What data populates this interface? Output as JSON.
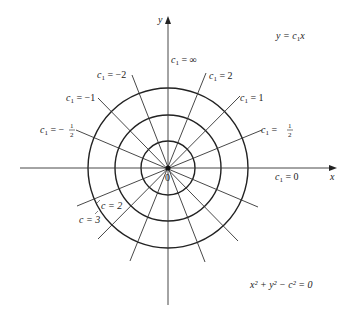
{
  "diagram": {
    "title_equation": "y = c₁x",
    "circle_equation": "x² + y² − c² = 0",
    "axes": {
      "x_label": "x",
      "y_label": "y",
      "origin_label": "0"
    },
    "center": [
      168,
      168
    ],
    "circles": [
      {
        "c": 1,
        "radius_px": 27
      },
      {
        "c": 2,
        "radius_px": 53,
        "label": "c = 2"
      },
      {
        "c": 3,
        "radius_px": 80,
        "label": "c = 3"
      }
    ],
    "lines": [
      {
        "c1": "∞",
        "label": "c₁ = ∞"
      },
      {
        "c1": "2",
        "label": "c₁ = 2"
      },
      {
        "c1": "1",
        "label": "c₁ = 1"
      },
      {
        "c1": "1/2",
        "label": "c₁ = 1/2"
      },
      {
        "c1": "0",
        "label": "c₁ = 0"
      },
      {
        "c1": "-1/2",
        "label": "c₁ = −1/2"
      },
      {
        "c1": "-1",
        "label": "c₁ = −1"
      },
      {
        "c1": "-2",
        "label": "c₁ = −2"
      }
    ],
    "text": {
      "c1_prefix": "c",
      "sub1": "1",
      "eq": " = ",
      "inf": "∞",
      "two": "2",
      "one": "1",
      "neg_two": "−2",
      "neg_one": "−1",
      "minus": "−",
      "zero": "0",
      "half_num": "1",
      "half_den": "2",
      "c": "c",
      "c_eq_2": "c = 2",
      "c_eq_3": "c = 3",
      "y_eq": "y = ",
      "x": "x",
      "y": "y",
      "circ_eq": "x² + y² − c² = 0"
    }
  }
}
